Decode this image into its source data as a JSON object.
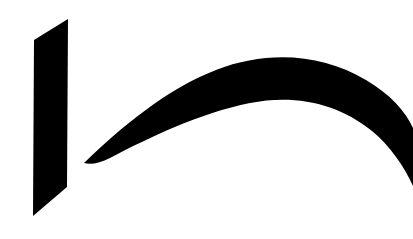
{
  "artwork": {
    "kind": "logo-mark",
    "title": "Abstract logo mark",
    "description": "A slanted solid black bar at left beside a thick tapering black arc sweeping from a fine point at lower-left up over an apex and down off the right edge.",
    "canvas": {
      "width": 413,
      "height": 239,
      "background_color": "#ffffff"
    },
    "colors": {
      "mark": "#000000",
      "background": "#ffffff"
    },
    "shapes": [
      {
        "name": "slanted-bar",
        "type": "polygon",
        "fill": "#000000",
        "points": "68,19 34,40 33,216 67,187"
      },
      {
        "name": "swoosh-arc",
        "type": "path",
        "fill": "#000000",
        "d": "M 84,163 C 120,128 168,88 216,70 C 268,50 322,54 366,80 C 390,94 406,112 413,128 L 413,186 C 404,166 390,146 372,131 C 338,103 294,94 250,103 C 200,113 148,138 110,158 C 100,163 91,165 84,163 Z"
      }
    ]
  }
}
